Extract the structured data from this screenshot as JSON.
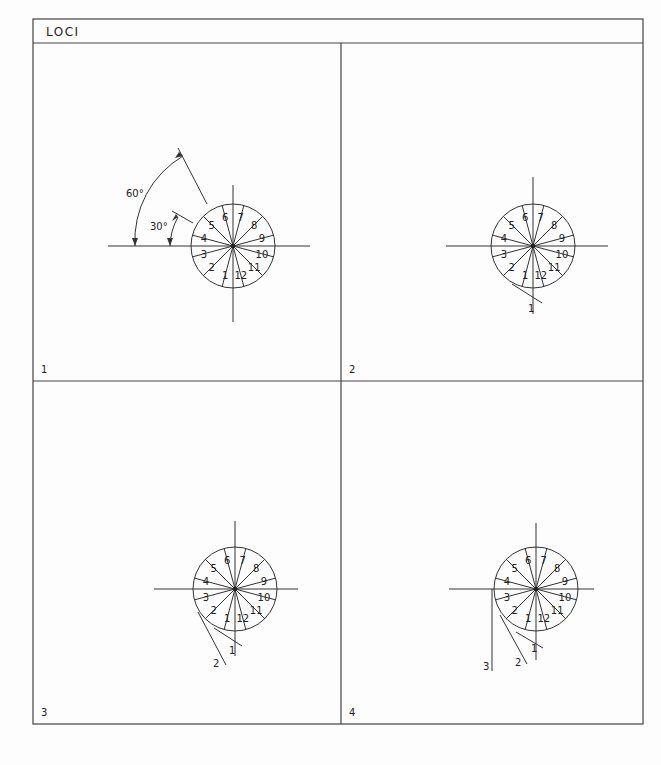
{
  "title": "LOCI",
  "panels": [
    {
      "number": "1",
      "cx": 233,
      "cy": 246,
      "angle_labels": [
        "60°",
        "30°"
      ]
    },
    {
      "number": "2",
      "cx": 533,
      "cy": 246,
      "locus_point_labels": [
        "1"
      ]
    },
    {
      "number": "3",
      "cx": 235,
      "cy": 589,
      "locus_point_labels": [
        "1",
        "2"
      ]
    },
    {
      "number": "4",
      "cx": 536,
      "cy": 589,
      "locus_point_labels": [
        "1",
        "2",
        "3"
      ]
    }
  ],
  "segment_labels": [
    "1",
    "2",
    "3",
    "4",
    "5",
    "6",
    "7",
    "8",
    "9",
    "10",
    "11",
    "12"
  ],
  "colors": {
    "line": "#333333",
    "background": "#fdfdfd"
  }
}
